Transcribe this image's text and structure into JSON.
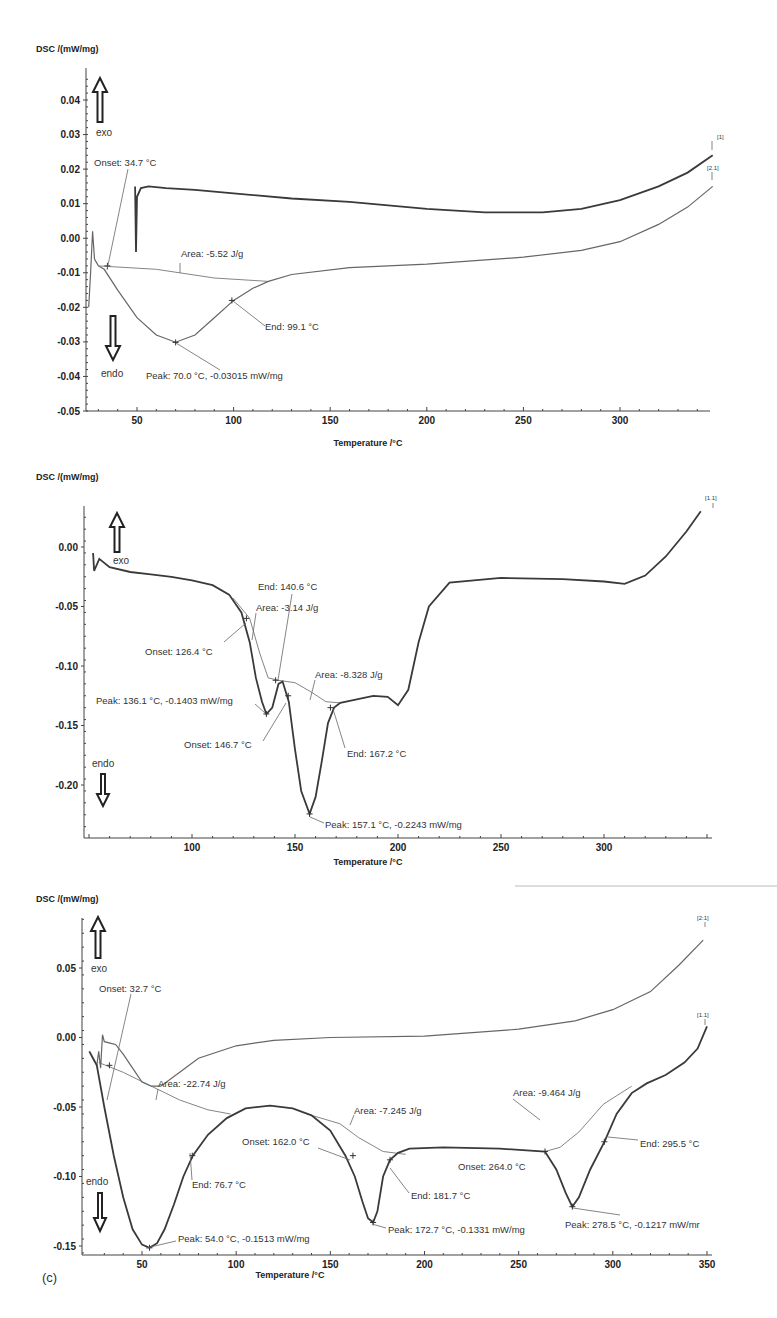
{
  "chart_data": [
    {
      "type": "line",
      "title": "",
      "ylabel": "DSC /(mW/mg)",
      "xlabel": "Temperature /°C",
      "xlim": [
        24,
        350
      ],
      "ylim": [
        -0.05,
        0.047
      ],
      "x_ticks": [
        50,
        100,
        150,
        200,
        250,
        300
      ],
      "y_ticks": [
        0.04,
        0.03,
        0.02,
        0.01,
        0.0,
        -0.01,
        -0.02,
        -0.03,
        -0.04,
        -0.05
      ],
      "y_tick_labels": [
        "0.04",
        "0.03",
        "0.02",
        "0.01",
        "0.00",
        "-0.01",
        "-0.02",
        "-0.03",
        "-0.04",
        "-0.05"
      ],
      "grid": false,
      "exo_label": "exo",
      "endo_label": "endo",
      "series": [
        {
          "name": "[1]",
          "style": "dark",
          "x": [
            49,
            49.5,
            50,
            52,
            56,
            65,
            80,
            100,
            130,
            160,
            200,
            230,
            260,
            280,
            300,
            320,
            335,
            348
          ],
          "values": [
            0.015,
            -0.004,
            0.012,
            0.0145,
            0.015,
            0.0145,
            0.014,
            0.013,
            0.0115,
            0.0105,
            0.0085,
            0.0075,
            0.0075,
            0.0085,
            0.011,
            0.015,
            0.019,
            0.024
          ]
        },
        {
          "name": "[2.1]",
          "style": "light",
          "x": [
            25,
            26,
            27,
            28,
            30,
            33,
            40,
            50,
            60,
            70,
            80,
            90,
            100,
            110,
            118,
            130,
            160,
            200,
            250,
            280,
            300,
            320,
            335,
            348
          ],
          "values": [
            -0.02,
            -0.01,
            0.002,
            -0.006,
            -0.008,
            -0.009,
            -0.015,
            -0.023,
            -0.028,
            -0.0301,
            -0.028,
            -0.023,
            -0.018,
            -0.0145,
            -0.0125,
            -0.0105,
            -0.0085,
            -0.0075,
            -0.0055,
            -0.0035,
            -0.001,
            0.004,
            0.009,
            0.015
          ]
        }
      ],
      "baselines": [
        {
          "x": [
            30,
            60,
            90,
            118
          ],
          "values": [
            -0.008,
            -0.009,
            -0.0115,
            -0.0125
          ]
        }
      ],
      "annotations": [
        {
          "text": "Onset: 34.7 °C",
          "x": 34.7,
          "y": -0.008
        },
        {
          "text": "Area: -5.52 J/g",
          "x": 80,
          "y": -0.009
        },
        {
          "text": "End: 99.1 °C",
          "x": 99.1,
          "y": -0.018
        },
        {
          "text": "Peak: 70.0 °C, -0.03015 mW/mg",
          "x": 70.0,
          "y": -0.03015
        }
      ],
      "curve_tags": [
        "[1]",
        "[2.1]"
      ]
    },
    {
      "type": "line",
      "title": "",
      "ylabel": "DSC /(mW/mg)",
      "xlabel": "Temperature /°C",
      "xlim": [
        27,
        350
      ],
      "ylim": [
        -0.235,
        0.03
      ],
      "x_ticks": [
        100,
        150,
        200,
        250,
        300
      ],
      "y_ticks": [
        0.0,
        -0.05,
        -0.1,
        -0.15,
        -0.2
      ],
      "y_tick_labels": [
        "0.00",
        "-0.05",
        "-0.10",
        "-0.15",
        "-0.20"
      ],
      "grid": false,
      "exo_label": "exo",
      "endo_label": "endo",
      "series": [
        {
          "name": "[1.1]",
          "style": "dark",
          "x": [
            52,
            52.5,
            55,
            60,
            70,
            80,
            90,
            100,
            110,
            118,
            124,
            128,
            131,
            134,
            136.1,
            139,
            142,
            144,
            147,
            150,
            153,
            157.1,
            160,
            163,
            166,
            169,
            172,
            180,
            188,
            195,
            200,
            205,
            210,
            215,
            225,
            250,
            280,
            300,
            310,
            320,
            330,
            340,
            347
          ],
          "values": [
            -0.005,
            -0.02,
            -0.01,
            -0.017,
            -0.021,
            -0.023,
            -0.025,
            -0.028,
            -0.032,
            -0.04,
            -0.055,
            -0.08,
            -0.11,
            -0.13,
            -0.1403,
            -0.135,
            -0.115,
            -0.113,
            -0.13,
            -0.17,
            -0.205,
            -0.2243,
            -0.21,
            -0.18,
            -0.148,
            -0.135,
            -0.131,
            -0.128,
            -0.125,
            -0.126,
            -0.133,
            -0.12,
            -0.08,
            -0.05,
            -0.03,
            -0.026,
            -0.027,
            -0.029,
            -0.031,
            -0.024,
            -0.008,
            0.013,
            0.03
          ]
        }
      ],
      "baselines": [
        {
          "x": [
            120,
            128,
            133,
            137,
            142
          ],
          "values": [
            -0.043,
            -0.06,
            -0.09,
            -0.11,
            -0.112
          ]
        },
        {
          "x": [
            142,
            150,
            158,
            165,
            172
          ],
          "values": [
            -0.112,
            -0.114,
            -0.122,
            -0.13,
            -0.131
          ]
        }
      ],
      "annotations": [
        {
          "text": "End: 140.6 °C",
          "x": 140.6,
          "y": -0.112
        },
        {
          "text": "Area: -3.14 J/g",
          "x": 132,
          "y": -0.07
        },
        {
          "text": "Onset: 126.4 °C",
          "x": 126.4,
          "y": -0.06
        },
        {
          "text": "Area: -8.328 J/g",
          "x": 160,
          "y": -0.124
        },
        {
          "text": "Peak: 136.1 °C, -0.1403 mW/mg",
          "x": 136.1,
          "y": -0.1403
        },
        {
          "text": "Onset: 146.7 °C",
          "x": 146.7,
          "y": -0.125
        },
        {
          "text": "End: 167.2 °C",
          "x": 167.2,
          "y": -0.135
        },
        {
          "text": "Peak: 157.1 °C, -0.2243 mW/mg",
          "x": 157.1,
          "y": -0.2243
        }
      ],
      "curve_tags": [
        "[1.1]"
      ]
    },
    {
      "type": "line",
      "title": "",
      "panel_label": "(c)",
      "ylabel": "DSC /(mW/mg)",
      "xlabel": "Temperature /°C",
      "xlim": [
        22,
        352
      ],
      "ylim": [
        -0.155,
        0.085
      ],
      "x_ticks": [
        50,
        100,
        150,
        200,
        250,
        300,
        350
      ],
      "y_ticks": [
        0.05,
        0.0,
        -0.05,
        -0.1,
        -0.15
      ],
      "y_tick_labels": [
        "0.05",
        "0.00",
        "-0.05",
        "-0.10",
        "-0.15"
      ],
      "grid": false,
      "exo_label": "exo",
      "endo_label": "endo",
      "series": [
        {
          "name": "[2.1]",
          "style": "light",
          "x": [
            26,
            27,
            28,
            29,
            30,
            33,
            36,
            40,
            45,
            50,
            55,
            60,
            70,
            80,
            100,
            120,
            150,
            200,
            250,
            280,
            300,
            320,
            335,
            348
          ],
          "values": [
            -0.02,
            -0.01,
            -0.022,
            0.002,
            -0.003,
            -0.004,
            -0.005,
            -0.012,
            -0.022,
            -0.032,
            -0.035,
            -0.035,
            -0.025,
            -0.015,
            -0.006,
            -0.002,
            0.0,
            0.001,
            0.006,
            0.012,
            0.02,
            0.033,
            0.052,
            0.07
          ]
        },
        {
          "name": "[1.1]",
          "style": "dark",
          "x": [
            22,
            24,
            26,
            30,
            35,
            40,
            45,
            50,
            54,
            58,
            62,
            67,
            72,
            77,
            85,
            95,
            105,
            118,
            130,
            140,
            150,
            158,
            163,
            167,
            170,
            172.7,
            175,
            178,
            181.7,
            186,
            192,
            210,
            240,
            264,
            270,
            275,
            278.5,
            282,
            288,
            295.5,
            302,
            310,
            318,
            328,
            338,
            345,
            350
          ],
          "values": [
            -0.01,
            -0.015,
            -0.02,
            -0.05,
            -0.085,
            -0.115,
            -0.138,
            -0.149,
            -0.1513,
            -0.148,
            -0.138,
            -0.12,
            -0.1,
            -0.085,
            -0.07,
            -0.058,
            -0.051,
            -0.049,
            -0.051,
            -0.056,
            -0.067,
            -0.085,
            -0.1,
            -0.118,
            -0.13,
            -0.1331,
            -0.125,
            -0.1,
            -0.088,
            -0.083,
            -0.08,
            -0.079,
            -0.08,
            -0.082,
            -0.095,
            -0.112,
            -0.1217,
            -0.115,
            -0.095,
            -0.075,
            -0.055,
            -0.04,
            -0.033,
            -0.027,
            -0.018,
            -0.008,
            0.008
          ]
        }
      ],
      "baselines": [
        {
          "x": [
            27,
            40,
            55,
            70,
            85,
            97
          ],
          "values": [
            -0.018,
            -0.025,
            -0.035,
            -0.045,
            -0.052,
            -0.055
          ]
        },
        {
          "x": [
            140,
            155,
            165,
            178,
            190
          ],
          "values": [
            -0.056,
            -0.062,
            -0.072,
            -0.082,
            -0.084
          ]
        },
        {
          "x": [
            264,
            272,
            282,
            295,
            310
          ],
          "values": [
            -0.082,
            -0.079,
            -0.068,
            -0.048,
            -0.035
          ]
        }
      ],
      "annotations": [
        {
          "text": "Onset: 32.7 °C",
          "x": 32.7,
          "y": -0.02
        },
        {
          "text": "Area: -22.74 J/g",
          "x": 55,
          "y": -0.035
        },
        {
          "text": "End: 76.7 °C",
          "x": 76.7,
          "y": -0.085
        },
        {
          "text": "Peak: 54.0 °C, -0.1513 mW/mg",
          "x": 54.0,
          "y": -0.1513
        },
        {
          "text": "Area: -7.245 J/g",
          "x": 165,
          "y": -0.068
        },
        {
          "text": "Onset: 162.0 °C",
          "x": 162.0,
          "y": -0.085
        },
        {
          "text": "End: 181.7 °C",
          "x": 181.7,
          "y": -0.088
        },
        {
          "text": "Peak: 172.7 °C, -0.1331 mW/mg",
          "x": 172.7,
          "y": -0.1331
        },
        {
          "text": "Area: -9.464 J/g",
          "x": 290,
          "y": -0.06
        },
        {
          "text": "Onset: 264.0 °C",
          "x": 264.0,
          "y": -0.082
        },
        {
          "text": "End: 295.5 °C",
          "x": 295.5,
          "y": -0.075
        },
        {
          "text": "Peak: 278.5 °C, -0.1217 mW/mr",
          "x": 278.5,
          "y": -0.1217
        }
      ],
      "curve_tags": [
        "[2:1]",
        "[1.1]"
      ]
    }
  ],
  "charts": [
    {
      "ylabel": "DSC /(mW/mg)",
      "xlabel": "Temperature /°C",
      "exo": "exo",
      "endo": "endo",
      "tags": [
        "[1]",
        "[2.1]"
      ],
      "ann": [
        "Onset: 34.7 °C",
        "Area: -5.52 J/g",
        "End: 99.1 °C",
        "Peak: 70.0 °C, -0.03015 mW/mg"
      ]
    },
    {
      "ylabel": "DSC /(mW/mg)",
      "xlabel": "Temperature /°C",
      "exo": "exo",
      "endo": "endo",
      "tags": [
        "[1.1]"
      ],
      "ann": [
        "End: 140.6 °C",
        "Area: -3.14 J/g",
        "Onset: 126.4 °C",
        "Area: -8.328 J/g",
        "Peak: 136.1 °C, -0.1403 mW/mg",
        "Onset: 146.7 °C",
        "End: 167.2 °C",
        "Peak: 157.1 °C, -0.2243 mW/mg"
      ]
    },
    {
      "ylabel": "DSC /(mW/mg)",
      "xlabel": "Temperature /°C",
      "exo": "exo",
      "endo": "endo",
      "panel": "(c)",
      "tags": [
        "[2:1]",
        "[1.1]"
      ],
      "ann": [
        "Onset: 32.7 °C",
        "Area: -22.74 J/g",
        "End: 76.7 °C",
        "Peak: 54.0 °C, -0.1513 mW/mg",
        "Area: -7.245 J/g",
        "Onset: 162.0 °C",
        "End: 181.7 °C",
        "Peak: 172.7 °C, -0.1331 mW/mg",
        "Area: -9.464 J/g",
        "Onset: 264.0 °C",
        "End: 295.5 °C",
        "Peak: 278.5 °C, -0.1217 mW/mr"
      ]
    }
  ]
}
